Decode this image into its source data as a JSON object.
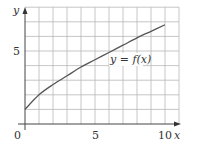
{
  "chart_data": {
    "type": "line",
    "title": "",
    "xlabel": "x",
    "ylabel": "y",
    "xlim": [
      0,
      11
    ],
    "ylim": [
      0,
      8
    ],
    "grid": true,
    "grid_step": 1,
    "x_ticks": [
      {
        "value": 0,
        "label": "0"
      },
      {
        "value": 5,
        "label": "5"
      },
      {
        "value": 10,
        "label": "10"
      }
    ],
    "y_ticks": [
      {
        "value": 5,
        "label": "5"
      }
    ],
    "series": [
      {
        "name": "y = f(x)",
        "x": [
          0,
          1,
          2,
          3,
          4,
          5,
          6,
          7,
          8,
          9,
          10
        ],
        "y": [
          1.0,
          2.0,
          2.7,
          3.3,
          3.9,
          4.4,
          4.9,
          5.4,
          5.9,
          6.35,
          6.8
        ]
      }
    ],
    "annotations": [
      {
        "text": "y = f(x)",
        "x": 7.1,
        "y": 4.4
      }
    ],
    "colors": {
      "grid": "#b8b8b8",
      "axis": "#444444",
      "curve": "#555555",
      "text": "#333333"
    }
  },
  "labels": {
    "x_axis": "x",
    "y_axis": "y",
    "origin": "0",
    "x_tick_5": "5",
    "x_tick_10": "10",
    "y_tick_5": "5",
    "curve": "y = f(x)"
  }
}
